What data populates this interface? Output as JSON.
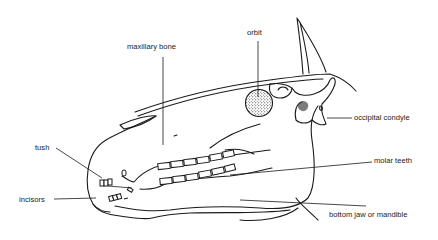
{
  "diagram": {
    "labels": [
      {
        "id": "maxillary-bone",
        "text": "maxillary bone"
      },
      {
        "id": "orbit",
        "text": "orbit"
      },
      {
        "id": "occipital-condyle",
        "text": "occipital condyle"
      },
      {
        "id": "tush",
        "text": "tush"
      },
      {
        "id": "molar-teeth",
        "text": "molar teeth"
      },
      {
        "id": "incisors",
        "text": "incisors"
      },
      {
        "id": "bottom-jaw",
        "text": "bottom jaw or mandible"
      }
    ],
    "colors": {
      "ink": "#1a1a1a",
      "background": "#ffffff"
    }
  }
}
